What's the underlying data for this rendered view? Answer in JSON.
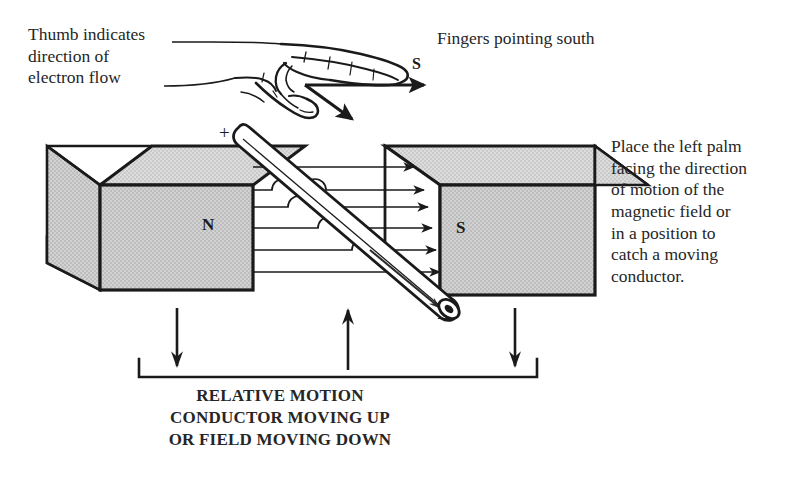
{
  "figure": {
    "kind": "physics-diagram",
    "background_color": "#ffffff",
    "ink_color": "#1a1a1a",
    "magnet_fill": "#c9c9c9",
    "magnet_top_fill": "#d4d4d4",
    "magnet_side_fill": "#ffffff"
  },
  "annotations": {
    "thumb_note": "Thumb indicates\ndirection of\nelectron flow",
    "fingers_note": "Fingers pointing south",
    "palm_note": "Place the left palm\nfacing the direction\nof motion of the\nmagnetic field or\nin a position to\ncatch a moving\nconductor."
  },
  "caption": {
    "line1": "RELATIVE MOTION",
    "line2": "CONDUCTOR MOVING UP",
    "line3": "OR FIELD MOVING DOWN",
    "full": "RELATIVE MOTION CONDUCTOR MOVING UP OR FIELD MOVING DOWN"
  },
  "magnets": {
    "left": {
      "pole_label": "N",
      "name": "north-pole-magnet"
    },
    "right": {
      "pole_label": "S",
      "name": "south-pole-magnet"
    }
  },
  "conductor": {
    "positive_terminal": "+",
    "negative_terminal": "–",
    "orientation": "diagonal-upper-left-to-lower-right"
  },
  "direction_markers": {
    "fingers_arrow_label": "S",
    "field_line_count": 6,
    "field_direction": "north-to-south-rightward",
    "conductor_motion": "up",
    "field_motion": "down"
  }
}
